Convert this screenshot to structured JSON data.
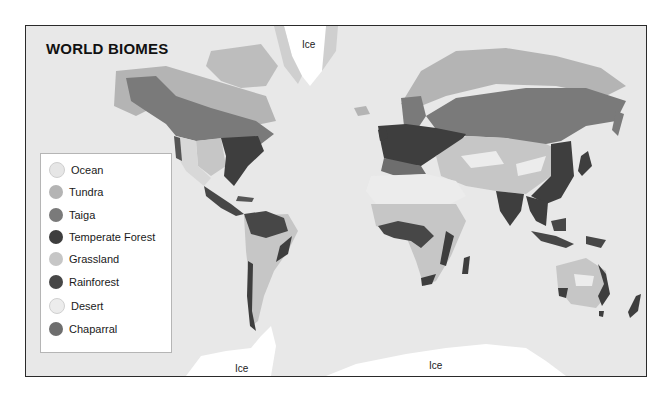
{
  "map": {
    "title": "WORLD BIOMES",
    "ice_labels": [
      {
        "text": "Ice",
        "x": 276,
        "y": 13
      },
      {
        "text": "Ice",
        "x": 209,
        "y": 337
      },
      {
        "text": "Ice",
        "x": 403,
        "y": 334
      }
    ]
  },
  "legend": {
    "items": [
      {
        "label": "Ocean",
        "color": "#e6e6e6"
      },
      {
        "label": "Tundra",
        "color": "#b4b4b4"
      },
      {
        "label": "Taiga",
        "color": "#7a7a7a"
      },
      {
        "label": "Temperate Forest",
        "color": "#3e3e3e"
      },
      {
        "label": "Grassland",
        "color": "#c6c6c6"
      },
      {
        "label": "Rainforest",
        "color": "#474747"
      },
      {
        "label": "Desert",
        "color": "#ececec"
      },
      {
        "label": "Chaparral",
        "color": "#6e6e6e"
      }
    ]
  },
  "colors": {
    "ocean": "#e8e8e8",
    "ice": "#ffffff",
    "tundra": "#b4b4b4",
    "taiga": "#7a7a7a",
    "temperate_forest": "#3e3e3e",
    "grassland": "#c6c6c6",
    "rainforest": "#474747",
    "desert": "#ececec",
    "frame": "#2a2a2a"
  }
}
